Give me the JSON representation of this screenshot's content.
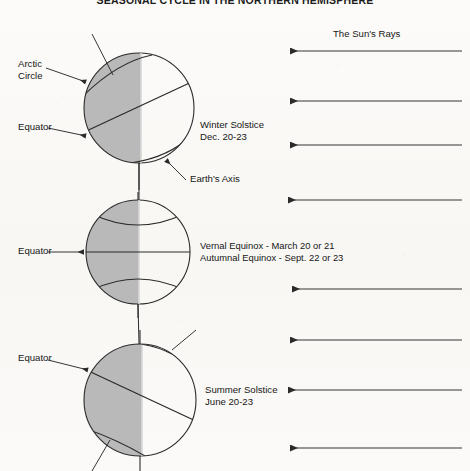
{
  "title": "SEASONAL CYCLE IN THE NORTHERN HEMISPHERE",
  "colors": {
    "night_shade": "#b9b9b9",
    "line": "#2b2b2b",
    "paper": "#fbfaf8",
    "text": "#161616"
  },
  "sun": {
    "rays_label": "The Sun's Rays",
    "ray_count": 8,
    "direction": "right-to-left"
  },
  "globes": [
    {
      "id": "winter-solstice",
      "season_label": "Winter Solstice",
      "date_label": "Dec. 20-23",
      "axis_label": "Earth's Axis",
      "left_labels": [
        "Arctic\nCircle",
        "Equator"
      ],
      "tilt_description": "north pole tilted away from sun"
    },
    {
      "id": "equinox",
      "season_label": "Vernal Equinox - March 20 or 21",
      "date_label": "Autumnal Equinox - Sept. 22 or 23",
      "left_labels": [
        "Equator"
      ],
      "tilt_description": "axis vertical, terminator through both poles"
    },
    {
      "id": "summer-solstice",
      "season_label": "Summer Solstice",
      "date_label": "June 20-23",
      "left_labels": [
        "Equator"
      ],
      "tilt_description": "north pole tilted toward sun"
    }
  ],
  "labels": {
    "arctic_circle_line1": "Arctic",
    "arctic_circle_line2": "Circle",
    "equator_1": "Equator",
    "equator_2": "Equator",
    "equator_3": "Equator",
    "winter_solstice": "Winter Solstice",
    "winter_date": "Dec. 20-23",
    "earths_axis": "Earth's Axis",
    "vernal_equinox": "Vernal Equinox - March 20 or 21",
    "autumnal_equinox": "Autumnal Equinox - Sept. 22 or 23",
    "summer_solstice": "Summer Solstice",
    "summer_date": "June 20-23",
    "suns_rays": "The Sun's Rays"
  }
}
